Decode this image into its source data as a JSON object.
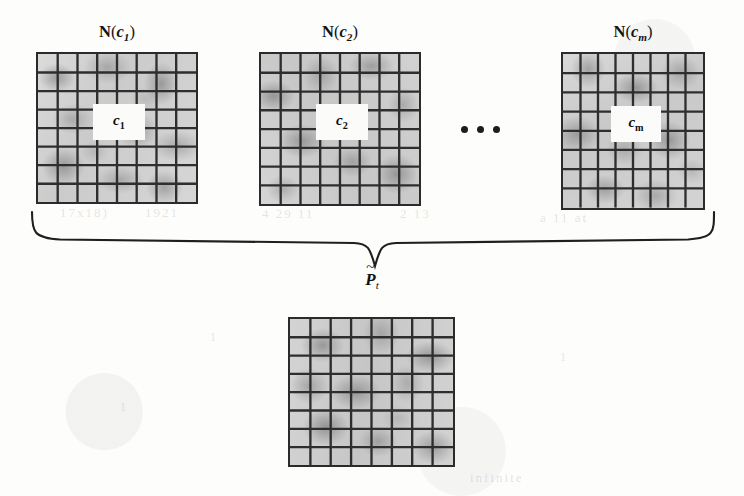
{
  "figure": {
    "neighborhoods": [
      {
        "id": "n1",
        "label_prefix": "N",
        "label_open": "(",
        "label_var": "c",
        "label_sub": "1",
        "label_close": ")",
        "center_var": "c",
        "center_sub": "1",
        "columns": 8,
        "rows": 8
      },
      {
        "id": "n2",
        "label_prefix": "N",
        "label_open": "(",
        "label_var": "c",
        "label_sub": "2",
        "label_close": ")",
        "center_var": "c",
        "center_sub": "2",
        "columns": 8,
        "rows": 8
      },
      {
        "id": "nm",
        "label_prefix": "N",
        "label_open": "(",
        "label_var": "c",
        "label_sub": "m",
        "label_close": ")",
        "center_var": "c",
        "center_sub": "m",
        "columns": 8,
        "rows": 8
      }
    ],
    "ellipsis": "...",
    "result": {
      "label_var": "P",
      "label_tilde": "~",
      "label_sub": "t",
      "columns": 8,
      "rows": 8
    },
    "brace": "}",
    "ghost_marks": [
      {
        "text": "17x18)",
        "x": 60,
        "y": 205,
        "size": 13
      },
      {
        "text": "1921",
        "x": 145,
        "y": 205,
        "size": 13
      },
      {
        "text": "4 29 11",
        "x": 262,
        "y": 206,
        "size": 13
      },
      {
        "text": "2 13",
        "x": 400,
        "y": 206,
        "size": 13
      },
      {
        "text": "a 11 at",
        "x": 540,
        "y": 210,
        "size": 13
      },
      {
        "text": "1",
        "x": 210,
        "y": 330,
        "size": 12
      },
      {
        "text": "1",
        "x": 120,
        "y": 400,
        "size": 12
      },
      {
        "text": "1",
        "x": 560,
        "y": 350,
        "size": 12
      },
      {
        "text": "infinite",
        "x": 470,
        "y": 470,
        "size": 13
      }
    ]
  },
  "colors": {
    "ink": "#1c1c1c",
    "grid_line": "#2b2b2b",
    "cell_fill": "#c6c6c6",
    "center_cell": "#fbfbfa",
    "paper": "#fdfdfc"
  }
}
